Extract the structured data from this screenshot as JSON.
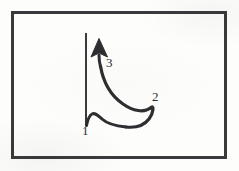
{
  "figure": {
    "kind": "hand-drawn-diagram",
    "background_color": "#fdfdfc",
    "ink_color": "#2e2e30",
    "frame": {
      "name": "rectangular-border",
      "x": 11,
      "y": 11,
      "width": 215,
      "height": 147,
      "stroke_width": 3,
      "color": "#3a3a3c"
    },
    "axis": {
      "name": "vertical-axis-line",
      "x": 86,
      "y_top": 33,
      "y_bottom": 126,
      "stroke_width": 2,
      "color": "#3a3a3c"
    },
    "arrow": {
      "name": "upward-arrowhead",
      "tip_x": 99,
      "tip_y": 39,
      "base_y": 56,
      "half_width": 8,
      "color": "#2e2e30"
    },
    "curve": {
      "name": "swept-curve",
      "stroke_width": 3,
      "color": "#2e2e30",
      "description": "descends from arrow base rightward and downward to a hook, then returns left along a wavy baseline to the axis foot"
    },
    "labels": [
      {
        "id": "label-1",
        "text": "1",
        "x": 82,
        "y": 124,
        "describes": "axis foot / curve start"
      },
      {
        "id": "label-2",
        "text": "2",
        "x": 152,
        "y": 90,
        "describes": "right-hand hook of curve"
      },
      {
        "id": "label-3",
        "text": "3",
        "x": 106,
        "y": 56,
        "describes": "arrow tip / curve end"
      }
    ]
  }
}
